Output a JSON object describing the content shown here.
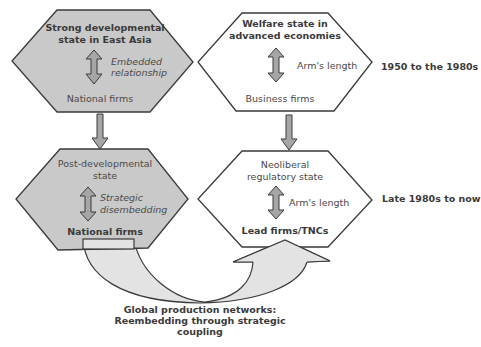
{
  "colors": {
    "developmental_fill": "#c9c9c9",
    "welfare_fill": "#ffffff",
    "outline": "#3a3a3a",
    "arrow_fill": "#a6a6a6",
    "coupling_arrow_fill": "#e3e3e3",
    "text": "#4a4a4a"
  },
  "nodes": {
    "strong_developmental": {
      "title_line1": "Strong developmental",
      "title_line2": "state in East Asia",
      "relation_line1": "Embedded",
      "relation_line2": "relationship",
      "firms": "National firms"
    },
    "welfare_state": {
      "title_line1": "Welfare state in",
      "title_line2": "advanced economies",
      "relation": "Arm's length",
      "firms": "Business firms"
    },
    "post_developmental": {
      "title_line1": "Post-developmental",
      "title_line2": "state",
      "relation_line1": "Strategic",
      "relation_line2": "disembedding",
      "firms": "National firms"
    },
    "neoliberal": {
      "title_line1": "Neoliberal",
      "title_line2": "regulatory state",
      "relation": "Arm's length",
      "firms": "Lead firms/TNCs"
    }
  },
  "periods": {
    "early": "1950 to the 1980s",
    "late": "Late 1980s to now"
  },
  "coupling": {
    "line1": "Global production networks:",
    "line2": "Reembedding through strategic",
    "line3": "coupling"
  }
}
